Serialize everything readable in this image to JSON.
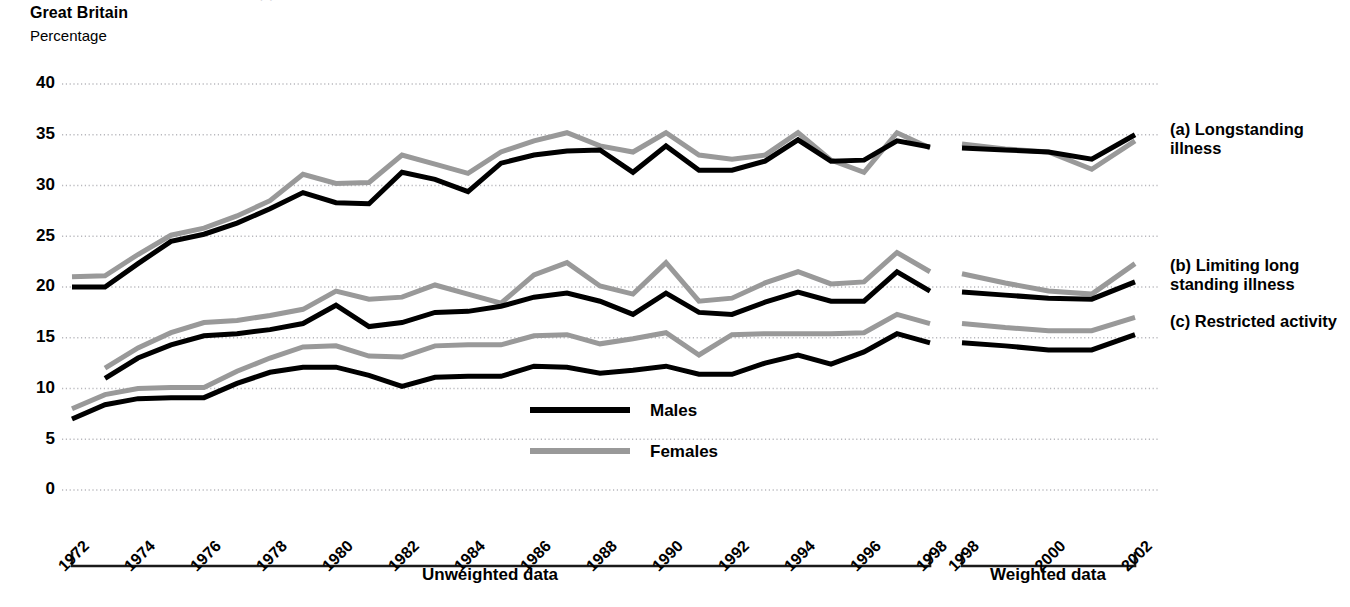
{
  "header": {
    "cut_off_title": "(                                                                        )",
    "region": "Great Britain",
    "units": "Percentage"
  },
  "legend": {
    "items": [
      {
        "label": "Males",
        "color": "#000000"
      },
      {
        "label": "Females",
        "color": "#999999"
      }
    ]
  },
  "series_labels": {
    "a": "(a) Longstanding illness",
    "b": "(b) Limiting long standing illness",
    "c": "(c) Restricted activity"
  },
  "axis": {
    "y_ticks": [
      "0",
      "5",
      "10",
      "15",
      "20",
      "25",
      "30",
      "35",
      "40"
    ],
    "x_ticks_unweighted": [
      "1972",
      "1974",
      "1976",
      "1978",
      "1980",
      "1982",
      "1984",
      "1986",
      "1988",
      "1990",
      "1992",
      "1994",
      "1996",
      "1998"
    ],
    "x_ticks_weighted": [
      "1998",
      "2000",
      "2002"
    ],
    "group_unweighted": "Unweighted data",
    "group_weighted": "Weighted data"
  },
  "colors": {
    "males": "#000000",
    "females": "#999999",
    "grid": "#b8b8bd",
    "axis": "#1a1a1a",
    "background": "#ffffff"
  },
  "chart_data": {
    "type": "line",
    "title": "Great Britain",
    "xlabel": "",
    "ylabel": "Percentage",
    "ylim": [
      0,
      40
    ],
    "ytick_step": 5,
    "grid": true,
    "legend_position": "center-bottom-inside",
    "annotations": [
      "Unweighted data",
      "Weighted data",
      "(a) Longstanding illness",
      "(b) Limiting long standing illness",
      "(c) Restricted activity"
    ],
    "panels": [
      {
        "name": "(a) Longstanding illness",
        "segments": [
          {
            "group": "Unweighted data",
            "x": [
              1972,
              1973,
              1974,
              1975,
              1976,
              1977,
              1978,
              1979,
              1980,
              1981,
              1982,
              1983,
              1984,
              1985,
              1986,
              1987,
              1988,
              1989,
              1990,
              1991,
              1992,
              1993,
              1994,
              1995,
              1996,
              1997,
              1998
            ],
            "series": [
              {
                "name": "Males",
                "values": [
                  20.0,
                  20.0,
                  22.3,
                  24.5,
                  25.2,
                  26.3,
                  27.7,
                  29.3,
                  28.3,
                  28.2,
                  31.3,
                  30.6,
                  29.4,
                  32.2,
                  33.0,
                  33.4,
                  33.5,
                  31.3,
                  33.9,
                  31.5,
                  31.5,
                  32.4,
                  34.5,
                  32.4,
                  32.5,
                  34.4,
                  33.8
                ]
              },
              {
                "name": "Females",
                "values": [
                  21.0,
                  21.1,
                  23.2,
                  25.1,
                  25.8,
                  27.0,
                  28.5,
                  31.1,
                  30.2,
                  30.3,
                  33.0,
                  32.1,
                  31.2,
                  33.3,
                  34.4,
                  35.2,
                  33.9,
                  33.3,
                  35.2,
                  33.0,
                  32.6,
                  33.0,
                  35.2,
                  32.5,
                  31.3,
                  35.2,
                  33.7
                ]
              }
            ]
          },
          {
            "group": "Weighted data",
            "x": [
              1998,
              1999,
              2000,
              2001,
              2002
            ],
            "series": [
              {
                "name": "Males",
                "values": [
                  33.7,
                  33.5,
                  33.3,
                  32.6,
                  35.0
                ]
              },
              {
                "name": "Females",
                "values": [
                  34.1,
                  33.6,
                  33.3,
                  31.6,
                  34.4
                ]
              }
            ]
          }
        ]
      },
      {
        "name": "(b) Limiting long standing illness",
        "segments": [
          {
            "group": "Unweighted data",
            "x": [
              1973,
              1974,
              1975,
              1976,
              1977,
              1978,
              1979,
              1980,
              1981,
              1982,
              1983,
              1984,
              1985,
              1986,
              1987,
              1988,
              1989,
              1990,
              1991,
              1992,
              1993,
              1994,
              1995,
              1996,
              1997,
              1998
            ],
            "series": [
              {
                "name": "Males",
                "values": [
                  11.0,
                  13.0,
                  14.3,
                  15.2,
                  15.4,
                  15.8,
                  16.4,
                  18.2,
                  16.1,
                  16.5,
                  17.5,
                  17.6,
                  18.1,
                  19.0,
                  19.4,
                  18.6,
                  17.3,
                  19.4,
                  17.5,
                  17.3,
                  18.5,
                  19.5,
                  18.6,
                  18.6,
                  21.5,
                  19.6
                ]
              },
              {
                "name": "Females",
                "values": [
                  12.0,
                  14.0,
                  15.5,
                  16.5,
                  16.7,
                  17.2,
                  17.8,
                  19.6,
                  18.8,
                  19.0,
                  20.2,
                  19.3,
                  18.4,
                  21.2,
                  22.4,
                  20.1,
                  19.3,
                  22.4,
                  18.6,
                  18.9,
                  20.4,
                  21.5,
                  20.3,
                  20.5,
                  23.4,
                  21.5
                ]
              }
            ]
          },
          {
            "group": "Weighted data",
            "x": [
              1998,
              1999,
              2000,
              2001,
              2002
            ],
            "series": [
              {
                "name": "Males",
                "values": [
                  19.5,
                  19.2,
                  18.9,
                  18.8,
                  20.5
                ]
              },
              {
                "name": "Females",
                "values": [
                  21.3,
                  20.4,
                  19.6,
                  19.3,
                  22.3
                ]
              }
            ]
          }
        ]
      },
      {
        "name": "(c) Restricted activity",
        "segments": [
          {
            "group": "Unweighted data",
            "x": [
              1972,
              1973,
              1974,
              1975,
              1976,
              1977,
              1978,
              1979,
              1980,
              1981,
              1982,
              1983,
              1984,
              1985,
              1986,
              1987,
              1988,
              1989,
              1990,
              1991,
              1992,
              1993,
              1994,
              1995,
              1996,
              1997,
              1998
            ],
            "series": [
              {
                "name": "Males",
                "values": [
                  7.0,
                  8.4,
                  9.0,
                  9.1,
                  9.1,
                  10.5,
                  11.6,
                  12.1,
                  12.1,
                  11.3,
                  10.2,
                  11.1,
                  11.2,
                  11.2,
                  12.2,
                  12.1,
                  11.5,
                  11.8,
                  12.2,
                  11.4,
                  11.4,
                  12.5,
                  13.3,
                  12.4,
                  13.6,
                  15.4,
                  14.5
                ]
              },
              {
                "name": "Females",
                "values": [
                  8.0,
                  9.4,
                  10.0,
                  10.1,
                  10.1,
                  11.7,
                  13.0,
                  14.1,
                  14.2,
                  13.2,
                  13.1,
                  14.2,
                  14.3,
                  14.3,
                  15.2,
                  15.3,
                  14.4,
                  14.9,
                  15.5,
                  13.3,
                  15.3,
                  15.4,
                  15.4,
                  15.4,
                  15.5,
                  17.3,
                  16.4
                ]
              }
            ]
          },
          {
            "group": "Weighted data",
            "x": [
              1998,
              1999,
              2000,
              2001,
              2002
            ],
            "series": [
              {
                "name": "Males",
                "values": [
                  14.5,
                  14.2,
                  13.8,
                  13.8,
                  15.3
                ]
              },
              {
                "name": "Females",
                "values": [
                  16.4,
                  16.0,
                  15.7,
                  15.7,
                  17.0
                ]
              }
            ]
          }
        ]
      }
    ]
  }
}
